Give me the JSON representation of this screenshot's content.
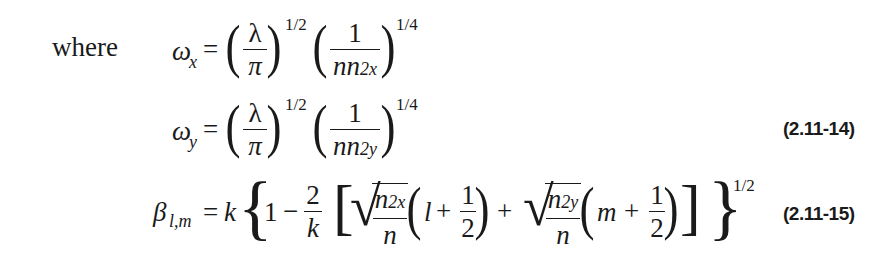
{
  "intro_word": "where",
  "equations": [
    {
      "lhs": "ω",
      "lhs_sub": "x",
      "rhs_text": "(λ/π)^(1/2) (1/(n n_2x))^(1/4)",
      "frac1": {
        "num": "λ",
        "den": "π"
      },
      "exp1": "1/2",
      "frac2": {
        "num": "1",
        "den": "nn",
        "den_sub": "2x"
      },
      "exp2": "1/4"
    },
    {
      "lhs": "ω",
      "lhs_sub": "y",
      "rhs_text": "(λ/π)^(1/2) (1/(n n_2y))^(1/4)",
      "frac1": {
        "num": "λ",
        "den": "π"
      },
      "exp1": "1/2",
      "frac2": {
        "num": "1",
        "den": "nn",
        "den_sub": "2y"
      },
      "exp2": "1/4",
      "number": "(2.11-14)"
    },
    {
      "lhs": "β",
      "lhs_sub": "l,m",
      "rhs_text": "k{1 − (2/k)[√(n_2x/n)(l + 1/2) + √(n_2y/n)(m + 1/2)]}^(1/2)",
      "k": "k",
      "one": "1",
      "minus": "−",
      "frac_2k": {
        "num": "2",
        "den": "k"
      },
      "sqrt1": {
        "num": "n",
        "num_sub": "2x",
        "den": "n"
      },
      "term1_var": "l",
      "plus": "+",
      "half": {
        "num": "1",
        "den": "2"
      },
      "sqrt2": {
        "num": "n",
        "num_sub": "2y",
        "den": "n"
      },
      "term2_var": "m",
      "exp": "1/2",
      "number": "(2.11-15)"
    }
  ],
  "symbols": {
    "equals": "=",
    "lparen": "(",
    "rparen": ")",
    "lbracket": "[",
    "rbracket": "]",
    "lbrace": "{",
    "rbrace": "}",
    "sqrt": "√"
  }
}
